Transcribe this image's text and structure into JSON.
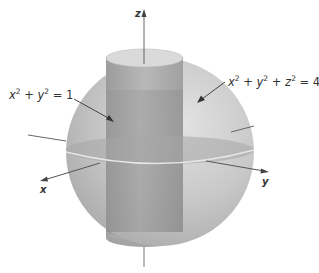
{
  "figure": {
    "axes": {
      "x_label": "x",
      "y_label": "y",
      "z_label": "z"
    },
    "annotations": [
      {
        "id": "cylinder",
        "text_parts": [
          "x",
          "2",
          " + ",
          "y",
          "2",
          " = 1"
        ],
        "equation": "x² + y² = 1"
      },
      {
        "id": "sphere",
        "text_parts": [
          "x",
          "2",
          " + ",
          "y",
          "2",
          " + ",
          "z",
          "2",
          " = 4"
        ],
        "equation": "x² + y² + z² = 4"
      }
    ],
    "colors": {
      "sphere_fill": "#c4c4c4",
      "sphere_light": "#dcdcdc",
      "cylinder_fill": "#9a9a9a",
      "cylinder_top": "#d8d8d8",
      "equator_plane": "#a8a8a8",
      "axis": "#555555",
      "text": "#333333"
    }
  }
}
